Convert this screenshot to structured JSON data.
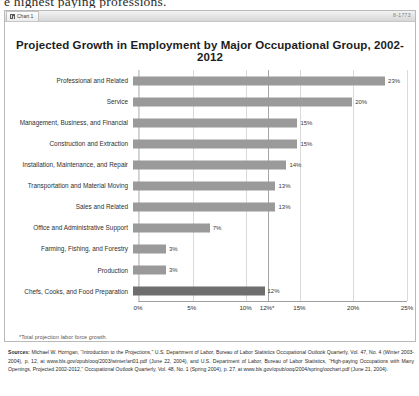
{
  "page": {
    "top_fragment": "e highest paying professions."
  },
  "window": {
    "tab_label": "Chart 1",
    "tab_icon": "chart-icon",
    "right_label": "8-1773"
  },
  "chart_data": {
    "type": "bar",
    "orientation": "horizontal",
    "title": "Projected Growth in Employment by Major Occupational Group, 2002-2012",
    "xlabel": "",
    "ylabel": "",
    "xlim": [
      0,
      25
    ],
    "grid": true,
    "legend": null,
    "categories": [
      "Professional and Related",
      "Service",
      "Management, Business, and Financial",
      "Construction and Extraction",
      "Installation, Maintenance, and Repair",
      "Transportation and Material Moving",
      "Sales and Related",
      "Office and Administrative Support",
      "Farming, Fishing, and Forestry",
      "Production",
      "Chefs, Cooks, and Food Preparation"
    ],
    "values": [
      23,
      20,
      15,
      15,
      14,
      13,
      13,
      7,
      3,
      3,
      12
    ],
    "value_labels": [
      "23%",
      "20%",
      "15%",
      "15%",
      "14%",
      "13%",
      "13%",
      "7%",
      "3%",
      "3%",
      "12%"
    ],
    "highlight_index": 10,
    "bar_color": "#9a9a9a",
    "highlight_color": "#6e6e6e",
    "xticks": [
      0,
      5,
      10,
      12,
      15,
      20,
      25
    ],
    "xtick_labels": [
      "0%",
      "5%",
      "10%",
      "12%*",
      "15%",
      "20%",
      "25%"
    ],
    "reference_line": {
      "value": 12,
      "label": "12%*"
    },
    "footnote": "*Total projection labor force growth."
  },
  "sources": {
    "label": "Sources:",
    "text": " Michael W. Horrigan, “Introduction to the Projections,” U.S. Department of Labor, Bureau of Labor Statistics Occupational Outlook Quarterly, Vol. 47, No. 4 (Winter 2003-2004), p. 12, at www.bls.gov/opub/ooq/2003/winter/art01.pdf (June 22, 2004), and U.S. Department of Labor, Bureau of Labor Statistics, “High-paying Occupations with Many Openings, Projected 2002-2012,” Occupational Outlook Quarterly, Vol. 48, No. 1 (Spring 2004), p. 27, at www.bls.gov/opub/ooq/2004/spring/oochart.pdf (June 21, 2004)."
  }
}
